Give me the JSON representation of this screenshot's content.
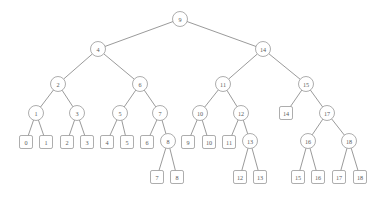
{
  "figure": {
    "name": "binary-search-tree-diagram",
    "type": "tree-diagram",
    "width": 386,
    "height": 199,
    "background_color": "#ffffff",
    "node_stroke_color": "#8a8a8a",
    "edge_stroke_color": "#6e6e6e",
    "label_color": "#5c5c5c",
    "internal_node_shape": "circle",
    "leaf_node_shape": "rounded-square"
  },
  "nodes": [
    {
      "id": "n9",
      "label": "9",
      "shape": "circle",
      "x": 180,
      "y": 19,
      "r": 7.5,
      "level": 0
    },
    {
      "id": "n4",
      "label": "4",
      "shape": "circle",
      "x": 98,
      "y": 49,
      "r": 7.5,
      "level": 1
    },
    {
      "id": "n14",
      "label": "14",
      "shape": "circle",
      "x": 263,
      "y": 49,
      "r": 7.5,
      "level": 1
    },
    {
      "id": "n2",
      "label": "2",
      "shape": "circle",
      "x": 58,
      "y": 84,
      "r": 7.5,
      "level": 2
    },
    {
      "id": "n6",
      "label": "6",
      "shape": "circle",
      "x": 140,
      "y": 84,
      "r": 7.5,
      "level": 2
    },
    {
      "id": "n11",
      "label": "11",
      "shape": "circle",
      "x": 223,
      "y": 84,
      "r": 7.5,
      "level": 2
    },
    {
      "id": "n15",
      "label": "15",
      "shape": "circle",
      "x": 306,
      "y": 84,
      "r": 7.5,
      "level": 2
    },
    {
      "id": "n1",
      "label": "1",
      "shape": "circle",
      "x": 36,
      "y": 113,
      "r": 7.5,
      "level": 3
    },
    {
      "id": "n3",
      "label": "3",
      "shape": "circle",
      "x": 77,
      "y": 113,
      "r": 7.5,
      "level": 3
    },
    {
      "id": "n5",
      "label": "5",
      "shape": "circle",
      "x": 120,
      "y": 113,
      "r": 7.5,
      "level": 3
    },
    {
      "id": "n7",
      "label": "7",
      "shape": "circle",
      "x": 160,
      "y": 113,
      "r": 7.5,
      "level": 3
    },
    {
      "id": "n10",
      "label": "10",
      "shape": "circle",
      "x": 200,
      "y": 113,
      "r": 7.5,
      "level": 3
    },
    {
      "id": "n12",
      "label": "12",
      "shape": "circle",
      "x": 241,
      "y": 113,
      "r": 7.5,
      "level": 3
    },
    {
      "id": "L14",
      "label": "14",
      "shape": "rect",
      "x": 286,
      "y": 113,
      "r": 6.5,
      "level": 3
    },
    {
      "id": "n17",
      "label": "17",
      "shape": "circle",
      "x": 327,
      "y": 113,
      "r": 7.5,
      "level": 3
    },
    {
      "id": "L0",
      "label": "0",
      "shape": "rect",
      "x": 26,
      "y": 142,
      "r": 6.5,
      "level": 4
    },
    {
      "id": "L1",
      "label": "1",
      "shape": "rect",
      "x": 46,
      "y": 142,
      "r": 6.5,
      "level": 4
    },
    {
      "id": "L2",
      "label": "2",
      "shape": "rect",
      "x": 67,
      "y": 142,
      "r": 6.5,
      "level": 4
    },
    {
      "id": "L3",
      "label": "3",
      "shape": "rect",
      "x": 87,
      "y": 142,
      "r": 6.5,
      "level": 4
    },
    {
      "id": "L4",
      "label": "4",
      "shape": "rect",
      "x": 107,
      "y": 142,
      "r": 6.5,
      "level": 4
    },
    {
      "id": "L5",
      "label": "5",
      "shape": "rect",
      "x": 127,
      "y": 142,
      "r": 6.5,
      "level": 4
    },
    {
      "id": "L6",
      "label": "6",
      "shape": "rect",
      "x": 147,
      "y": 142,
      "r": 6.5,
      "level": 4
    },
    {
      "id": "n8",
      "label": "8",
      "shape": "circle",
      "x": 168,
      "y": 141,
      "r": 7.5,
      "level": 4
    },
    {
      "id": "L9",
      "label": "9",
      "shape": "rect",
      "x": 188,
      "y": 142,
      "r": 6.5,
      "level": 4
    },
    {
      "id": "L10",
      "label": "10",
      "shape": "rect",
      "x": 209,
      "y": 142,
      "r": 6.5,
      "level": 4
    },
    {
      "id": "L11",
      "label": "11",
      "shape": "rect",
      "x": 229,
      "y": 142,
      "r": 6.5,
      "level": 4
    },
    {
      "id": "n13",
      "label": "13",
      "shape": "circle",
      "x": 250,
      "y": 141,
      "r": 7.5,
      "level": 4
    },
    {
      "id": "n16",
      "label": "16",
      "shape": "circle",
      "x": 308,
      "y": 141,
      "r": 7.5,
      "level": 4
    },
    {
      "id": "n18",
      "label": "18",
      "shape": "circle",
      "x": 349,
      "y": 141,
      "r": 7.5,
      "level": 4
    },
    {
      "id": "L7",
      "label": "7",
      "shape": "rect",
      "x": 157,
      "y": 177,
      "r": 6.5,
      "level": 5
    },
    {
      "id": "L8",
      "label": "8",
      "shape": "rect",
      "x": 177,
      "y": 177,
      "r": 6.5,
      "level": 5
    },
    {
      "id": "L12",
      "label": "12",
      "shape": "rect",
      "x": 240,
      "y": 177,
      "r": 6.5,
      "level": 5
    },
    {
      "id": "L13",
      "label": "13",
      "shape": "rect",
      "x": 260,
      "y": 177,
      "r": 6.5,
      "level": 5
    },
    {
      "id": "L15",
      "label": "15",
      "shape": "rect",
      "x": 298,
      "y": 177,
      "r": 6.5,
      "level": 5
    },
    {
      "id": "L16",
      "label": "16",
      "shape": "rect",
      "x": 318,
      "y": 177,
      "r": 6.5,
      "level": 5
    },
    {
      "id": "L17",
      "label": "17",
      "shape": "rect",
      "x": 339,
      "y": 177,
      "r": 6.5,
      "level": 5
    },
    {
      "id": "L18",
      "label": "18",
      "shape": "rect",
      "x": 360,
      "y": 177,
      "r": 6.5,
      "level": 5
    }
  ],
  "edges": [
    {
      "from": "n9",
      "to": "n4"
    },
    {
      "from": "n9",
      "to": "n14"
    },
    {
      "from": "n4",
      "to": "n2"
    },
    {
      "from": "n4",
      "to": "n6"
    },
    {
      "from": "n14",
      "to": "n11"
    },
    {
      "from": "n14",
      "to": "n15"
    },
    {
      "from": "n2",
      "to": "n1"
    },
    {
      "from": "n2",
      "to": "n3"
    },
    {
      "from": "n6",
      "to": "n5"
    },
    {
      "from": "n6",
      "to": "n7"
    },
    {
      "from": "n11",
      "to": "n10"
    },
    {
      "from": "n11",
      "to": "n12"
    },
    {
      "from": "n15",
      "to": "L14"
    },
    {
      "from": "n15",
      "to": "n17"
    },
    {
      "from": "n1",
      "to": "L0"
    },
    {
      "from": "n1",
      "to": "L1"
    },
    {
      "from": "n3",
      "to": "L2"
    },
    {
      "from": "n3",
      "to": "L3"
    },
    {
      "from": "n5",
      "to": "L4"
    },
    {
      "from": "n5",
      "to": "L5"
    },
    {
      "from": "n7",
      "to": "L6"
    },
    {
      "from": "n7",
      "to": "n8"
    },
    {
      "from": "n10",
      "to": "L9"
    },
    {
      "from": "n10",
      "to": "L10"
    },
    {
      "from": "n12",
      "to": "L11"
    },
    {
      "from": "n12",
      "to": "n13"
    },
    {
      "from": "n17",
      "to": "n16"
    },
    {
      "from": "n17",
      "to": "n18"
    },
    {
      "from": "n8",
      "to": "L7"
    },
    {
      "from": "n8",
      "to": "L8"
    },
    {
      "from": "n13",
      "to": "L12"
    },
    {
      "from": "n13",
      "to": "L13"
    },
    {
      "from": "n16",
      "to": "L15"
    },
    {
      "from": "n16",
      "to": "L16"
    },
    {
      "from": "n18",
      "to": "L17"
    },
    {
      "from": "n18",
      "to": "L18"
    }
  ]
}
